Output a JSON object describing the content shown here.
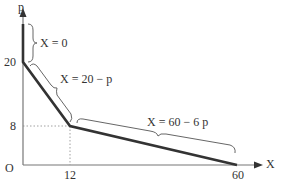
{
  "diagram": {
    "axes": {
      "x_label": "X",
      "y_label": "p",
      "origin_label": "O"
    },
    "ticks": {
      "y_20": "20",
      "y_8": "8",
      "x_12": "12",
      "x_60": "60"
    },
    "segments": [
      {
        "equation": "X = 0",
        "range": "p > 20"
      },
      {
        "equation": "X = 20 − p",
        "range": "8 ≤ p ≤ 20"
      },
      {
        "equation": "X = 60 − 6 p",
        "range": "0 ≤ p ≤ 8"
      }
    ],
    "kink_point": {
      "X": 12,
      "p": 8
    },
    "colors": {
      "curve": "#333333",
      "axis": "#777777",
      "guide": "#888888"
    }
  }
}
